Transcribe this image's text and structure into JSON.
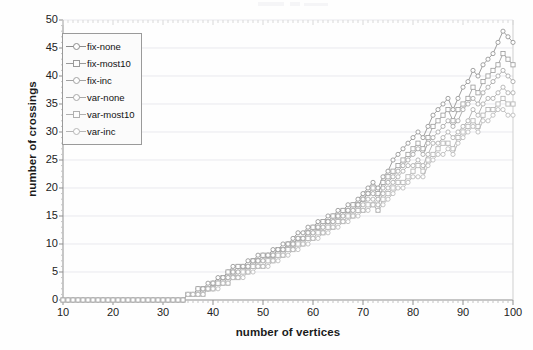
{
  "chart_data": {
    "type": "line",
    "title": "",
    "xlabel": "number of vertices",
    "ylabel": "number of crossings",
    "xlim": [
      10,
      100
    ],
    "ylim": [
      0,
      50
    ],
    "xticks": [
      10,
      20,
      30,
      40,
      50,
      60,
      70,
      80,
      90,
      100
    ],
    "yticks": [
      0,
      5,
      10,
      15,
      20,
      25,
      30,
      35,
      40,
      45,
      50
    ],
    "grid": "horizontal",
    "legend_position": "top-left",
    "minor_ticks": "every 1 unit on x-axis",
    "x": [
      10,
      11,
      12,
      13,
      14,
      15,
      16,
      17,
      18,
      19,
      20,
      21,
      22,
      23,
      24,
      25,
      26,
      27,
      28,
      29,
      30,
      31,
      32,
      33,
      34,
      35,
      36,
      37,
      38,
      39,
      40,
      41,
      42,
      43,
      44,
      45,
      46,
      47,
      48,
      49,
      50,
      51,
      52,
      53,
      54,
      55,
      56,
      57,
      58,
      59,
      60,
      61,
      62,
      63,
      64,
      65,
      66,
      67,
      68,
      69,
      70,
      71,
      72,
      73,
      74,
      75,
      76,
      77,
      78,
      79,
      80,
      81,
      82,
      83,
      84,
      85,
      86,
      87,
      88,
      89,
      90,
      91,
      92,
      93,
      94,
      95,
      96,
      97,
      98,
      99,
      100
    ],
    "series": [
      {
        "name": "fix-none",
        "marker": "circle",
        "color": "#8d8d8d",
        "values": [
          0,
          0,
          0,
          0,
          0,
          0,
          0,
          0,
          0,
          0,
          0,
          0,
          0,
          0,
          0,
          0,
          0,
          0,
          0,
          0,
          0,
          0,
          0,
          0,
          0,
          1,
          1,
          2,
          2,
          3,
          3,
          4,
          4,
          5,
          6,
          6,
          6,
          7,
          7,
          8,
          8,
          8,
          9,
          9,
          10,
          10,
          11,
          12,
          12,
          13,
          13,
          14,
          14,
          15,
          15,
          16,
          16,
          17,
          17,
          18,
          19,
          20,
          21,
          20,
          22,
          23,
          25,
          26,
          27,
          28,
          29,
          30,
          29,
          31,
          33,
          34,
          35,
          36,
          34,
          36,
          38,
          39,
          41,
          40,
          42,
          43,
          44,
          46,
          48,
          47,
          46
        ]
      },
      {
        "name": "fix-most10",
        "marker": "square",
        "color": "#9a9a9a",
        "values": [
          0,
          0,
          0,
          0,
          0,
          0,
          0,
          0,
          0,
          0,
          0,
          0,
          0,
          0,
          0,
          0,
          0,
          0,
          0,
          0,
          0,
          0,
          0,
          0,
          0,
          1,
          1,
          2,
          2,
          2,
          3,
          3,
          4,
          5,
          5,
          6,
          6,
          6,
          7,
          7,
          8,
          8,
          8,
          9,
          9,
          10,
          10,
          11,
          11,
          12,
          13,
          13,
          14,
          14,
          15,
          15,
          16,
          16,
          17,
          17,
          18,
          19,
          20,
          19,
          21,
          22,
          23,
          24,
          25,
          26,
          27,
          28,
          27,
          29,
          31,
          32,
          33,
          34,
          32,
          34,
          35,
          36,
          38,
          37,
          39,
          40,
          41,
          42,
          44,
          43,
          42
        ]
      },
      {
        "name": "fix-inc",
        "marker": "circle",
        "color": "#a2a2a2",
        "values": [
          0,
          0,
          0,
          0,
          0,
          0,
          0,
          0,
          0,
          0,
          0,
          0,
          0,
          0,
          0,
          0,
          0,
          0,
          0,
          0,
          0,
          0,
          0,
          0,
          0,
          1,
          1,
          1,
          2,
          2,
          3,
          3,
          4,
          4,
          5,
          5,
          6,
          6,
          7,
          7,
          7,
          8,
          8,
          9,
          9,
          10,
          10,
          11,
          11,
          12,
          12,
          13,
          13,
          14,
          14,
          15,
          15,
          16,
          16,
          17,
          18,
          19,
          19,
          18,
          20,
          21,
          22,
          23,
          24,
          25,
          26,
          27,
          26,
          28,
          29,
          30,
          31,
          32,
          31,
          32,
          34,
          35,
          36,
          35,
          37,
          38,
          39,
          40,
          41,
          40,
          39
        ]
      },
      {
        "name": "var-none",
        "marker": "circle",
        "color": "#a8a8a8",
        "values": [
          0,
          0,
          0,
          0,
          0,
          0,
          0,
          0,
          0,
          0,
          0,
          0,
          0,
          0,
          0,
          0,
          0,
          0,
          0,
          0,
          0,
          0,
          0,
          0,
          0,
          1,
          1,
          1,
          2,
          2,
          2,
          3,
          3,
          4,
          4,
          5,
          5,
          6,
          6,
          7,
          7,
          7,
          8,
          8,
          9,
          9,
          10,
          10,
          11,
          11,
          12,
          12,
          13,
          13,
          14,
          14,
          15,
          15,
          16,
          16,
          17,
          18,
          18,
          17,
          19,
          20,
          21,
          22,
          23,
          24,
          24,
          25,
          24,
          26,
          28,
          28,
          29,
          30,
          29,
          30,
          31,
          32,
          34,
          33,
          35,
          36,
          36,
          37,
          38,
          37,
          37
        ]
      },
      {
        "name": "var-most10",
        "marker": "square",
        "color": "#b0b0b0",
        "values": [
          0,
          0,
          0,
          0,
          0,
          0,
          0,
          0,
          0,
          0,
          0,
          0,
          0,
          0,
          0,
          0,
          0,
          0,
          0,
          0,
          0,
          0,
          0,
          0,
          0,
          1,
          1,
          1,
          1,
          2,
          2,
          3,
          3,
          3,
          4,
          4,
          5,
          5,
          6,
          6,
          6,
          7,
          7,
          8,
          8,
          9,
          9,
          10,
          10,
          11,
          11,
          12,
          12,
          13,
          13,
          14,
          14,
          15,
          15,
          16,
          16,
          17,
          17,
          16,
          18,
          19,
          20,
          21,
          21,
          22,
          23,
          24,
          23,
          25,
          26,
          27,
          28,
          28,
          27,
          29,
          30,
          31,
          32,
          31,
          33,
          34,
          34,
          35,
          36,
          35,
          35
        ]
      },
      {
        "name": "var-inc",
        "marker": "circle",
        "color": "#b6b6b6",
        "values": [
          0,
          0,
          0,
          0,
          0,
          0,
          0,
          0,
          0,
          0,
          0,
          0,
          0,
          0,
          0,
          0,
          0,
          0,
          0,
          0,
          0,
          0,
          0,
          0,
          0,
          1,
          1,
          1,
          1,
          2,
          2,
          2,
          3,
          3,
          4,
          4,
          4,
          5,
          5,
          6,
          6,
          6,
          7,
          7,
          8,
          8,
          9,
          9,
          10,
          10,
          11,
          11,
          12,
          12,
          13,
          13,
          14,
          14,
          15,
          15,
          16,
          16,
          17,
          16,
          17,
          18,
          19,
          20,
          20,
          21,
          22,
          22,
          22,
          24,
          25,
          26,
          26,
          27,
          26,
          28,
          29,
          30,
          31,
          30,
          32,
          32,
          33,
          34,
          34,
          33,
          33
        ]
      }
    ]
  },
  "axes": {
    "y_title": "number of crossings",
    "x_title": "number of vertices",
    "y_labels": [
      "50",
      "45",
      "40",
      "35",
      "30",
      "25",
      "20",
      "15",
      "10",
      "5",
      "0"
    ],
    "x_labels": [
      "10",
      "20",
      "30",
      "40",
      "50",
      "60",
      "70",
      "80",
      "90",
      "100"
    ]
  },
  "legend": {
    "items": [
      {
        "label": "fix-none",
        "marker": "circle"
      },
      {
        "label": "fix-most10",
        "marker": "square"
      },
      {
        "label": "fix-inc",
        "marker": "circle"
      },
      {
        "label": "var-none",
        "marker": "circle"
      },
      {
        "label": "var-most10",
        "marker": "square"
      },
      {
        "label": "var-inc",
        "marker": "circle"
      }
    ]
  },
  "style": {
    "grid_color": "#e9e9ee",
    "axis_color": "#8f8f8f",
    "text_color": "#1b1b1b",
    "background": "#fefefe"
  }
}
